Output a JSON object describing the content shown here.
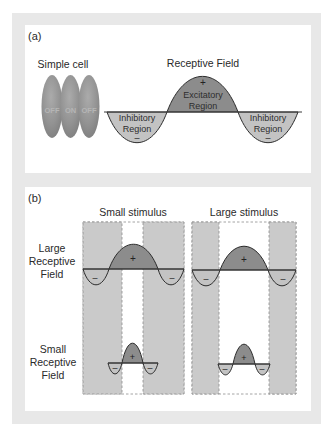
{
  "colors": {
    "frame": "#e8e8e8",
    "panel": "#ffffff",
    "excitatory": "#8c8c8c",
    "inhibitory": "#c3c3c3",
    "stimulus_column": "#cacaca"
  },
  "panel_a": {
    "label": "(a)",
    "simple_cell": {
      "title": "Simple cell",
      "subregions": [
        "OFF",
        "ON",
        "OFF"
      ]
    },
    "receptive_field": {
      "title": "Receptive Field",
      "excitatory": {
        "sign": "+",
        "line1": "Excitatory",
        "line2": "Region"
      },
      "inhibitory_left": {
        "line1": "Inhibitory",
        "line2": "Region",
        "sign": "–"
      },
      "inhibitory_right": {
        "line1": "Inhibitory",
        "line2": "Region",
        "sign": "–"
      }
    }
  },
  "panel_b": {
    "label": "(b)",
    "columns": [
      {
        "title": "Small stimulus"
      },
      {
        "title": "Large stimulus"
      }
    ],
    "rows": [
      {
        "label": [
          "Large",
          "Receptive",
          "Field"
        ]
      },
      {
        "label": [
          "Small",
          "Receptive",
          "Field"
        ]
      }
    ],
    "signs": {
      "plus": "+",
      "minus": "–"
    }
  }
}
